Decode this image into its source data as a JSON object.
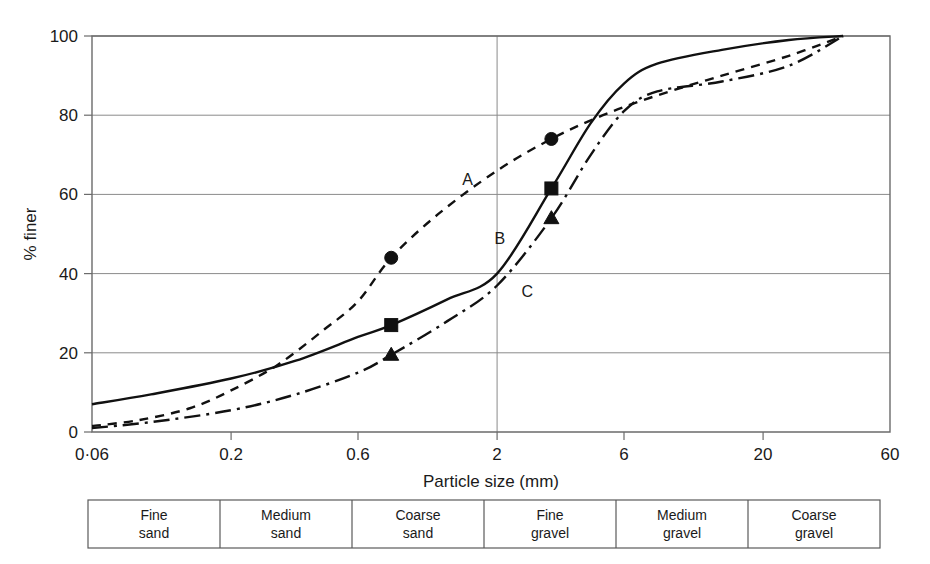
{
  "chart_data": {
    "type": "line",
    "title": "",
    "xlabel": "Particle size (mm)",
    "ylabel": "% finer",
    "xscale": "log",
    "xlim": [
      0.06,
      60
    ],
    "ylim": [
      0,
      100
    ],
    "grid": true,
    "grid_x_values": [
      2
    ],
    "grid_y_values": [
      20,
      40,
      60,
      80,
      100
    ],
    "legend_position": "inline-labels",
    "xticks": [
      {
        "value": 0.06,
        "label": "0·06"
      },
      {
        "value": 0.2,
        "label": "0.2"
      },
      {
        "value": 0.6,
        "label": "0.6"
      },
      {
        "value": 2,
        "label": "2"
      },
      {
        "value": 6,
        "label": "6"
      },
      {
        "value": 20,
        "label": "20"
      },
      {
        "value": 60,
        "label": "60"
      }
    ],
    "yticks": [
      {
        "value": 0,
        "label": "0"
      },
      {
        "value": 20,
        "label": "20"
      },
      {
        "value": 40,
        "label": "40"
      },
      {
        "value": 60,
        "label": "60"
      },
      {
        "value": 80,
        "label": "80"
      },
      {
        "value": 100,
        "label": "100"
      }
    ],
    "series": [
      {
        "name": "A",
        "label": "A",
        "linestyle": "dashed",
        "marker": "circle",
        "color": "#111111",
        "label_point": {
          "x": 1.55,
          "y": 62.5
        },
        "points": [
          {
            "x": 0.06,
            "y": 1.5
          },
          {
            "x": 0.09,
            "y": 3.0
          },
          {
            "x": 0.14,
            "y": 6.0
          },
          {
            "x": 0.2,
            "y": 10.5
          },
          {
            "x": 0.3,
            "y": 17.0
          },
          {
            "x": 0.45,
            "y": 26.0
          },
          {
            "x": 0.6,
            "y": 33.0
          },
          {
            "x": 0.8,
            "y": 44.0
          },
          {
            "x": 1.2,
            "y": 55.0
          },
          {
            "x": 2.0,
            "y": 66.0
          },
          {
            "x": 3.2,
            "y": 74.0
          },
          {
            "x": 5.0,
            "y": 80.0
          },
          {
            "x": 8.0,
            "y": 85.0
          },
          {
            "x": 14.0,
            "y": 90.0
          },
          {
            "x": 25.0,
            "y": 95.0
          },
          {
            "x": 40.0,
            "y": 100.0
          }
        ],
        "markers": [
          {
            "x": 0.8,
            "y": 44.0
          },
          {
            "x": 3.2,
            "y": 74.0
          }
        ]
      },
      {
        "name": "B",
        "label": "B",
        "linestyle": "solid",
        "marker": "square",
        "color": "#111111",
        "label_point": {
          "x": 2.05,
          "y": 47.5
        },
        "points": [
          {
            "x": 0.06,
            "y": 7.0
          },
          {
            "x": 0.1,
            "y": 9.5
          },
          {
            "x": 0.2,
            "y": 13.5
          },
          {
            "x": 0.35,
            "y": 18.0
          },
          {
            "x": 0.6,
            "y": 24.0
          },
          {
            "x": 0.8,
            "y": 27.0
          },
          {
            "x": 1.3,
            "y": 33.5
          },
          {
            "x": 2.0,
            "y": 40.0
          },
          {
            "x": 3.2,
            "y": 61.5
          },
          {
            "x": 4.5,
            "y": 78.0
          },
          {
            "x": 6.0,
            "y": 88.0
          },
          {
            "x": 8.0,
            "y": 93.0
          },
          {
            "x": 14.0,
            "y": 96.5
          },
          {
            "x": 25.0,
            "y": 99.0
          },
          {
            "x": 40.0,
            "y": 100.0
          }
        ],
        "markers": [
          {
            "x": 0.8,
            "y": 27.0
          },
          {
            "x": 3.2,
            "y": 61.5
          }
        ]
      },
      {
        "name": "C",
        "label": "C",
        "linestyle": "dash-dot",
        "marker": "triangle",
        "color": "#111111",
        "label_point": {
          "x": 2.6,
          "y": 34.0
        },
        "points": [
          {
            "x": 0.06,
            "y": 1.0
          },
          {
            "x": 0.1,
            "y": 2.5
          },
          {
            "x": 0.2,
            "y": 5.5
          },
          {
            "x": 0.35,
            "y": 9.5
          },
          {
            "x": 0.6,
            "y": 15.0
          },
          {
            "x": 0.8,
            "y": 19.5
          },
          {
            "x": 1.3,
            "y": 28.0
          },
          {
            "x": 2.0,
            "y": 37.0
          },
          {
            "x": 3.2,
            "y": 54.0
          },
          {
            "x": 4.5,
            "y": 70.0
          },
          {
            "x": 6.0,
            "y": 81.0
          },
          {
            "x": 8.0,
            "y": 86.0
          },
          {
            "x": 14.0,
            "y": 88.5
          },
          {
            "x": 25.0,
            "y": 92.5
          },
          {
            "x": 40.0,
            "y": 100.0
          }
        ],
        "markers": [
          {
            "x": 0.8,
            "y": 19.5
          },
          {
            "x": 3.2,
            "y": 54.0
          }
        ]
      }
    ]
  },
  "soil_classification_table": {
    "cells": [
      {
        "line1": "Fine",
        "line2": "sand"
      },
      {
        "line1": "Medium",
        "line2": "sand"
      },
      {
        "line1": "Coarse",
        "line2": "sand"
      },
      {
        "line1": "Fine",
        "line2": "gravel"
      },
      {
        "line1": "Medium",
        "line2": "gravel"
      },
      {
        "line1": "Coarse",
        "line2": "gravel"
      }
    ]
  }
}
